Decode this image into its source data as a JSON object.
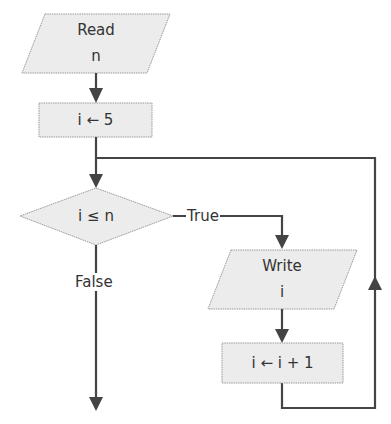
{
  "diagram": {
    "type": "flowchart",
    "nodes": {
      "read": {
        "kind": "input-output",
        "line1": "Read",
        "line2": "n"
      },
      "init": {
        "kind": "process",
        "label": "i ← 5"
      },
      "cond": {
        "kind": "decision",
        "label": "i ≤ n"
      },
      "write": {
        "kind": "input-output",
        "line1": "Write",
        "line2": "i"
      },
      "inc": {
        "kind": "process",
        "label": "i ← i + 1"
      }
    },
    "edges": {
      "true_label": "True",
      "false_label": "False"
    },
    "colors": {
      "shape_fill": "#ececec",
      "shape_border": "#9a9a9a",
      "edge": "#444444",
      "text": "#333333"
    }
  }
}
